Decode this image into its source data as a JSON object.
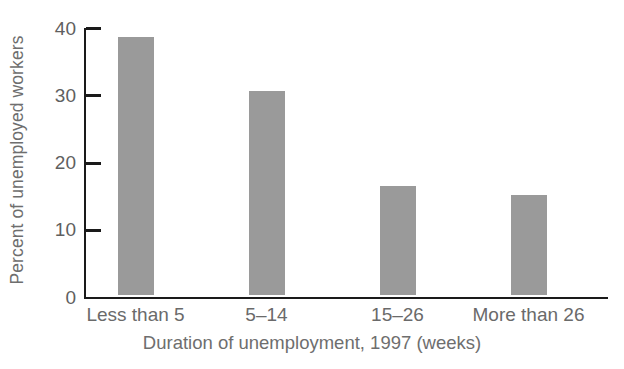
{
  "chart_data": {
    "type": "bar",
    "title": "",
    "xlabel": "Duration of unemployment, 1997 (weeks)",
    "ylabel": "Percent of unemployed workers",
    "categories": [
      "Less than 5",
      "5–14",
      "15–26",
      "More than 26"
    ],
    "values": [
      38.3,
      30.4,
      16.2,
      14.8
    ],
    "ylim": [
      0,
      40
    ],
    "yticks": [
      0,
      10,
      20,
      30,
      40
    ],
    "ytick_labels": [
      "0",
      "10",
      "20",
      "30",
      "40"
    ],
    "grid": false,
    "legend": null,
    "bar_color": "#9a9a9a",
    "axis_color": "#1a1a1a",
    "text_color": "#6a6a6a",
    "series": [
      {
        "name": "Percent of unemployed workers",
        "values": [
          38.3,
          30.4,
          16.2,
          14.8
        ]
      }
    ]
  }
}
